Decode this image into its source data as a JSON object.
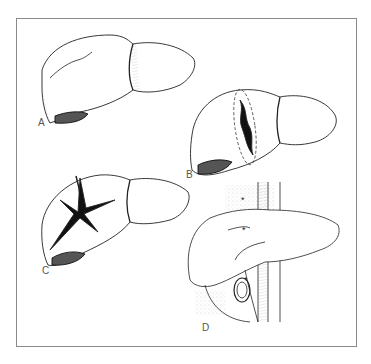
{
  "figure": {
    "type": "medical-illustration",
    "panels": [
      {
        "id": "A",
        "label": "A",
        "description": "liver with superficial capsular laceration"
      },
      {
        "id": "B",
        "label": "B",
        "description": "liver with deep laceration outlined by dashed line"
      },
      {
        "id": "C",
        "label": "C",
        "description": "liver with stellate (star-shaped) rupture"
      },
      {
        "id": "D",
        "label": "D",
        "description": "liver with hepatic vessels, vena cava and gallbladder; asterisks mark injury sites"
      }
    ],
    "markers": [
      "*",
      "*",
      "*"
    ],
    "colors": {
      "line": "#222222",
      "border": "#8a8a8a",
      "background": "#ffffff",
      "shade": "#bbbbbb"
    }
  }
}
